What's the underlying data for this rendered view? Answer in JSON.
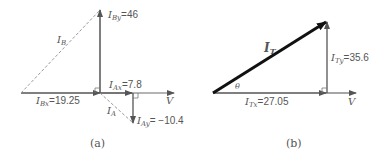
{
  "diagram_a": {
    "caption": "(a)",
    "labels": {
      "IBy": "=46",
      "IB": "I",
      "IAx": "=7.8",
      "IBx": "=19.25",
      "IA": "I",
      "IAy": "= −10.4",
      "V": "V"
    },
    "subs": {
      "IBy": "By",
      "IB": "B",
      "IAx": "Ax",
      "IBx": "Bx",
      "IA": "A",
      "IAy": "Ay"
    }
  },
  "diagram_b": {
    "caption": "(b)",
    "labels": {
      "IT": "I",
      "ITy": "=35.6",
      "ITx": "=27.05",
      "theta": "θ",
      "V": "V"
    },
    "subs": {
      "IT": "T",
      "ITy": "Ty",
      "ITx": "Tx"
    }
  },
  "colors": {
    "line": "#6a6a6a",
    "thick": "#111111",
    "dashed": "#9a9a9a"
  }
}
